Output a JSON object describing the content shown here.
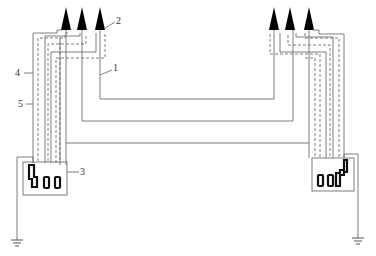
{
  "diagram": {
    "type": "grounding / wiring schematic",
    "labels": [
      {
        "id": "1",
        "text": "1",
        "x": 113,
        "y": 66
      },
      {
        "id": "2",
        "text": "2",
        "x": 116,
        "y": 18
      },
      {
        "id": "3",
        "text": "3",
        "x": 80,
        "y": 168
      },
      {
        "id": "4",
        "text": "4",
        "x": 16,
        "y": 70
      },
      {
        "id": "5",
        "text": "5",
        "x": 19,
        "y": 101
      }
    ],
    "colors": {
      "line": "#6b6b6b",
      "arrow": "#000000",
      "terminal": "#111111"
    }
  }
}
